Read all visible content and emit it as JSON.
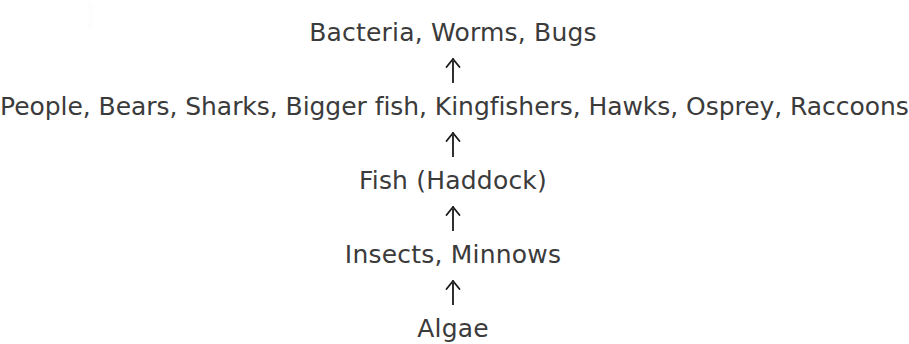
{
  "diagram": {
    "type": "food-chain",
    "background_color": "#ffffff",
    "text_color": "#3b3b3b",
    "arrow_color": "#1a1a1a",
    "arrow_direction": "up",
    "arrow_glyph": "↑",
    "arrow_count": 4,
    "levels": [
      {
        "order": 5,
        "label": "Bacteria, Worms, Bugs"
      },
      {
        "order": 4,
        "label": "People, Bears, Sharks, Bigger fish, Kingfishers, Hawks, Osprey, Raccoons"
      },
      {
        "order": 3,
        "label": "Fish (Haddock)"
      },
      {
        "order": 2,
        "label": "Insects, Minnows"
      },
      {
        "order": 1,
        "label": "Algae"
      }
    ],
    "arrows": [
      {
        "from": "Bacteria, Worms, Bugs",
        "to": "People, Bears, Sharks, Bigger fish, Kingfishers, Hawks, Osprey, Raccoons"
      },
      {
        "from": "People, Bears, Sharks, Bigger fish, Kingfishers, Hawks, Osprey, Raccoons",
        "to": "Fish (Haddock)"
      },
      {
        "from": "Fish (Haddock)",
        "to": "Insects, Minnows"
      },
      {
        "from": "Insects, Minnows",
        "to": "Algae"
      }
    ]
  }
}
